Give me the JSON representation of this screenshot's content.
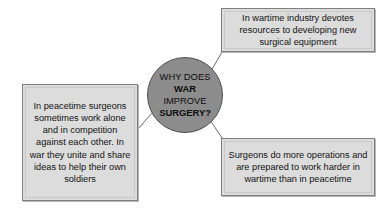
{
  "diagram": {
    "background_color": "#ffffff",
    "center": {
      "shape": "circle",
      "fill_color": "#8c8c8c",
      "border_color": "#4f4f4f",
      "lines": [
        {
          "text": "WHY DOES",
          "bold": false
        },
        {
          "text": "WAR",
          "bold": true
        },
        {
          "text": "IMPROVE",
          "bold": false
        },
        {
          "text": "SURGERY?",
          "bold": true
        }
      ]
    },
    "boxes": {
      "top": {
        "text": "In wartime industry devotes resources to developing new surgical equipment",
        "fill_color": "#dcdcdc",
        "border_color": "#7e7e7e"
      },
      "left": {
        "text": "In peacetime surgeons sometimes work alone and in competition against each other. In war they unite and share ideas to help their own soldiers",
        "fill_color": "#dcdcdc",
        "border_color": "#7e7e7e"
      },
      "bottom": {
        "text": "Surgeons do more operations and are prepared to work harder in wartime than in peacetime",
        "fill_color": "#dcdcdc",
        "border_color": "#7e7e7e"
      }
    },
    "connectors": [
      {
        "name": "center-to-top-box",
        "from": [
          211,
          71
        ],
        "to": [
          222,
          52
        ],
        "color": "#6e6e6e"
      },
      {
        "name": "center-to-bottom-box",
        "from": [
          210,
          120
        ],
        "to": [
          222,
          138
        ],
        "color": "#6e6e6e"
      },
      {
        "name": "center-to-left-box",
        "from": [
          152,
          113
        ],
        "to": [
          138,
          129
        ],
        "color": "#6e6e6e"
      }
    ]
  }
}
